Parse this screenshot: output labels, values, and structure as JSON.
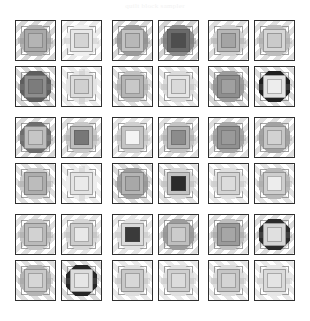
{
  "caption": {
    "text": "quilt block sampler"
  },
  "figure": {
    "rows": 6,
    "columns": 6,
    "column_groups": 3,
    "row_groups": 3,
    "tile_size_px": 41,
    "background": "#ffffff",
    "border_color": "#2f2f2f"
  },
  "palette": {
    "white": "#ffffff",
    "very_light": "#ececec",
    "light": "#d8d8d8",
    "light_mid": "#c6c6c6",
    "mid": "#b0b0b0",
    "mid_dark": "#949494",
    "dark": "#6f6f6f",
    "darker": "#4a4a4a",
    "near_black": "#262626",
    "black": "#1a1a1a",
    "band": "rgba(120,120,120,0.28)",
    "band_light": "rgba(140,140,140,0.20)",
    "outline": "#2f2f2f"
  },
  "layout": {
    "col_x": [
      15,
      61,
      112,
      158,
      208,
      254
    ],
    "row_y": [
      6,
      52,
      103,
      149,
      200,
      246
    ]
  },
  "tiles": [
    {
      "id": "r1c1",
      "row": 1,
      "col": 1,
      "dir": "dir-a",
      "band": "rgba(120,120,120,0.30)",
      "oct": "#b0b0b0",
      "mid": "#a8a8a8",
      "inn": "#b4b4b4",
      "rib": "rgba(150,150,150,0.45)",
      "ribbon": "h"
    },
    {
      "id": "r1c2",
      "row": 1,
      "col": 2,
      "dir": "dir-a",
      "band": "rgba(150,150,150,0.20)",
      "oct": "#f0f0f0",
      "mid": "#e8e8e8",
      "inn": "#d4d4d4",
      "rib": "rgba(190,190,190,0.40)",
      "ribbon": "h"
    },
    {
      "id": "r1c3",
      "row": 1,
      "col": 3,
      "dir": "dir-a",
      "band": "rgba(120,120,120,0.30)",
      "oct": "#9a9a9a",
      "mid": "#c2c2c2",
      "inn": "#b8b8b8",
      "rib": "rgba(140,140,140,0.45)",
      "ribbon": "h"
    },
    {
      "id": "r1c4",
      "row": 1,
      "col": 4,
      "dir": "dir-a",
      "band": "rgba(110,110,110,0.30)",
      "oct": "#8a8a8a",
      "mid": "#6a6a6a",
      "inn": "#4e4e4e",
      "rib": "rgba(120,120,120,0.45)",
      "ribbon": "h"
    },
    {
      "id": "r1c5",
      "row": 1,
      "col": 5,
      "dir": "dir-a",
      "band": "rgba(130,130,130,0.26)",
      "oct": "#d0d0d0",
      "mid": "#b6b6b6",
      "inn": "#a4a4a4",
      "rib": "rgba(160,160,160,0.42)",
      "ribbon": "h"
    },
    {
      "id": "r1c6",
      "row": 1,
      "col": 6,
      "dir": "dir-a",
      "band": "rgba(130,130,130,0.26)",
      "oct": "#bdbdbd",
      "mid": "#d6d6d6",
      "inn": "#cacaca",
      "rib": "rgba(165,165,165,0.40)",
      "ribbon": "h"
    },
    {
      "id": "r2c1",
      "row": 2,
      "col": 1,
      "dir": "dir-b",
      "band": "rgba(120,120,120,0.30)",
      "oct": "#5e5e5e",
      "mid": "#8e8e8e",
      "inn": "#7c7c7c",
      "rib": "rgba(130,130,130,0.40)",
      "ribbon": "h"
    },
    {
      "id": "r2c2",
      "row": 2,
      "col": 2,
      "dir": "dir-b",
      "band": "rgba(150,150,150,0.18)",
      "oct": "#e4e4e4",
      "mid": "#dcdcdc",
      "inn": "#d0d0d0",
      "rib": "rgba(190,190,190,0.38)",
      "ribbon": "v"
    },
    {
      "id": "r2c3",
      "row": 2,
      "col": 3,
      "dir": "dir-b",
      "band": "rgba(130,130,130,0.26)",
      "oct": "#c0c0c0",
      "mid": "#b4b4b4",
      "inn": "#c8c8c8",
      "rib": "rgba(160,160,160,0.40)",
      "ribbon": "h"
    },
    {
      "id": "r2c4",
      "row": 2,
      "col": 4,
      "dir": "dir-b",
      "band": "rgba(140,140,140,0.22)",
      "oct": "#dadada",
      "mid": "#e6e6e6",
      "inn": "#dadada",
      "rib": "rgba(180,180,180,0.38)",
      "ribbon": "h"
    },
    {
      "id": "r2c5",
      "row": 2,
      "col": 5,
      "dir": "dir-b",
      "band": "rgba(120,120,120,0.30)",
      "oct": "#9c9c9c",
      "mid": "#8e8e8e",
      "inn": "#a0a0a0",
      "rib": "rgba(140,140,140,0.42)",
      "ribbon": "h"
    },
    {
      "id": "r2c6",
      "row": 2,
      "col": 6,
      "dir": "dir-b",
      "band": "rgba(120,120,120,0.26)",
      "oct": "#1f1f1f",
      "mid": "#e2e2e2",
      "inn": "#ededed",
      "rib": "rgba(120,120,120,0.30)",
      "ribbon": "h"
    },
    {
      "id": "r3c1",
      "row": 3,
      "col": 1,
      "dir": "dir-a",
      "band": "rgba(120,120,120,0.28)",
      "oct": "#6e6e6e",
      "mid": "#bcbcbc",
      "inn": "#c6c6c6",
      "rib": "rgba(140,140,140,0.40)",
      "ribbon": "h"
    },
    {
      "id": "r3c2",
      "row": 3,
      "col": 2,
      "dir": "dir-a",
      "band": "rgba(130,130,130,0.26)",
      "oct": "#c8c8c8",
      "mid": "#bdbdbd",
      "inn": "#777777",
      "rib": "rgba(160,160,160,0.40)",
      "ribbon": "h"
    },
    {
      "id": "r3c3",
      "row": 3,
      "col": 3,
      "dir": "dir-a",
      "band": "rgba(140,140,140,0.24)",
      "oct": "#cfcfcf",
      "mid": "#c4c4c4",
      "inn": "#f4f4f4",
      "rib": "rgba(170,170,170,0.40)",
      "ribbon": "h"
    },
    {
      "id": "r3c4",
      "row": 3,
      "col": 4,
      "dir": "dir-a",
      "band": "rgba(130,130,130,0.26)",
      "oct": "#c4c4c4",
      "mid": "#b2b2b2",
      "inn": "#8c8c8c",
      "rib": "rgba(160,160,160,0.40)",
      "ribbon": "h"
    },
    {
      "id": "r3c5",
      "row": 3,
      "col": 5,
      "dir": "dir-a",
      "band": "rgba(130,130,130,0.26)",
      "oct": "#a6a6a6",
      "mid": "#909090",
      "inn": "#9a9a9a",
      "rib": "rgba(150,150,150,0.42)",
      "ribbon": "h"
    },
    {
      "id": "r3c6",
      "row": 3,
      "col": 6,
      "dir": "dir-a",
      "band": "rgba(130,130,130,0.26)",
      "oct": "#a2a2a2",
      "mid": "#c6c6c6",
      "inn": "#d2d2d2",
      "rib": "rgba(155,155,155,0.40)",
      "ribbon": "h"
    },
    {
      "id": "r4c1",
      "row": 4,
      "col": 1,
      "dir": "dir-b",
      "band": "rgba(130,130,130,0.26)",
      "oct": "#cacaca",
      "mid": "#adadad",
      "inn": "#bcbcbc",
      "rib": "rgba(160,160,160,0.40)",
      "ribbon": "h"
    },
    {
      "id": "r4c2",
      "row": 4,
      "col": 2,
      "dir": "dir-b",
      "band": "rgba(150,150,150,0.18)",
      "oct": "#ededed",
      "mid": "#e4e4e4",
      "inn": "#eaeaea",
      "rib": "rgba(190,190,190,0.36)",
      "ribbon": "v"
    },
    {
      "id": "r4c3",
      "row": 4,
      "col": 3,
      "dir": "dir-b",
      "band": "rgba(125,125,125,0.28)",
      "oct": "#9e9e9e",
      "mid": "#b4b4b4",
      "inn": "#a8a8a8",
      "rib": "rgba(145,145,145,0.42)",
      "ribbon": "h"
    },
    {
      "id": "r4c4",
      "row": 4,
      "col": 4,
      "dir": "dir-b",
      "band": "rgba(130,130,130,0.24)",
      "oct": "#d6d6d6",
      "mid": "#c2c2c2",
      "inn": "#2b2b2b",
      "rib": "rgba(170,170,170,0.38)",
      "ribbon": "h"
    },
    {
      "id": "r4c5",
      "row": 4,
      "col": 5,
      "dir": "dir-b",
      "band": "rgba(145,145,145,0.20)",
      "oct": "#e0e0e0",
      "mid": "#d4d4d4",
      "inn": "#dcdcdc",
      "rib": "rgba(180,180,180,0.38)",
      "ribbon": "h"
    },
    {
      "id": "r4c6",
      "row": 4,
      "col": 6,
      "dir": "dir-b",
      "band": "rgba(135,135,135,0.24)",
      "oct": "#b8b8b8",
      "mid": "#cecece",
      "inn": "#ededed",
      "rib": "rgba(165,165,165,0.40)",
      "ribbon": "h"
    },
    {
      "id": "r5c1",
      "row": 5,
      "col": 1,
      "dir": "dir-a",
      "band": "rgba(130,130,130,0.26)",
      "oct": "#c4c4c4",
      "mid": "#bababa",
      "inn": "#d2d2d2",
      "rib": "rgba(160,160,160,0.40)",
      "ribbon": "h"
    },
    {
      "id": "r5c2",
      "row": 5,
      "col": 2,
      "dir": "dir-a",
      "band": "rgba(140,140,140,0.22)",
      "oct": "#d6d6d6",
      "mid": "#cccccc",
      "inn": "#e8e8e8",
      "rib": "rgba(175,175,175,0.38)",
      "ribbon": "h"
    },
    {
      "id": "r5c3",
      "row": 5,
      "col": 3,
      "dir": "dir-a",
      "band": "rgba(140,140,140,0.22)",
      "oct": "#e2e2e2",
      "mid": "#dadada",
      "inn": "#3a3a3a",
      "rib": "rgba(180,180,180,0.36)",
      "ribbon": "h"
    },
    {
      "id": "r5c4",
      "row": 5,
      "col": 4,
      "dir": "dir-a",
      "band": "rgba(125,125,125,0.28)",
      "oct": "#9c9c9c",
      "mid": "#bebebe",
      "inn": "#cccccc",
      "rib": "rgba(145,145,145,0.42)",
      "ribbon": "h"
    },
    {
      "id": "r5c5",
      "row": 5,
      "col": 5,
      "dir": "dir-a",
      "band": "rgba(130,130,130,0.26)",
      "oct": "#bfbfbf",
      "mid": "#9a9a9a",
      "inn": "#a6a6a6",
      "rib": "rgba(155,155,155,0.42)",
      "ribbon": "h"
    },
    {
      "id": "r5c6",
      "row": 5,
      "col": 6,
      "dir": "dir-a",
      "band": "rgba(120,120,120,0.26)",
      "oct": "#2a2a2a",
      "mid": "#d4d4d4",
      "inn": "#e0e0e0",
      "rib": "rgba(120,120,120,0.28)",
      "ribbon": "h"
    },
    {
      "id": "r6c1",
      "row": 6,
      "col": 1,
      "dir": "dir-b",
      "band": "rgba(130,130,130,0.26)",
      "oct": "#b4b4b4",
      "mid": "#c8c8c8",
      "inn": "#d6d6d6",
      "rib": "rgba(160,160,160,0.40)",
      "ribbon": "h"
    },
    {
      "id": "r6c2",
      "row": 6,
      "col": 2,
      "dir": "dir-b",
      "band": "rgba(120,120,120,0.28)",
      "oct": "#262626",
      "mid": "#dcdcdc",
      "inn": "#e6e6e6",
      "rib": "rgba(120,120,120,0.28)",
      "ribbon": "h"
    },
    {
      "id": "r6c3",
      "row": 6,
      "col": 3,
      "dir": "dir-b",
      "band": "rgba(145,145,145,0.20)",
      "oct": "#dedede",
      "mid": "#c8c8c8",
      "inn": "#d8d8d8",
      "rib": "rgba(180,180,180,0.38)",
      "ribbon": "h"
    },
    {
      "id": "r6c4",
      "row": 6,
      "col": 4,
      "dir": "dir-b",
      "band": "rgba(145,145,145,0.20)",
      "oct": "#e0e0e0",
      "mid": "#cfcfcf",
      "inn": "#dcdcdc",
      "rib": "rgba(180,180,180,0.36)",
      "ribbon": "h"
    },
    {
      "id": "r6c5",
      "row": 6,
      "col": 5,
      "dir": "dir-b",
      "band": "rgba(140,140,140,0.22)",
      "oct": "#dcdcdc",
      "mid": "#c6c6c6",
      "inn": "#d4d4d4",
      "rib": "rgba(175,175,175,0.38)",
      "ribbon": "h"
    },
    {
      "id": "r6c6",
      "row": 6,
      "col": 6,
      "dir": "dir-b",
      "band": "rgba(145,145,145,0.20)",
      "oct": "#e6e6e6",
      "mid": "#dadada",
      "inn": "#e4e4e4",
      "rib": "rgba(185,185,185,0.36)",
      "ribbon": "h"
    }
  ]
}
